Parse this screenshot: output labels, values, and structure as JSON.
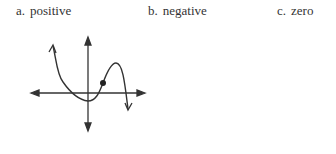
{
  "options": [
    {
      "letter": "a.",
      "label": "positive"
    },
    {
      "letter": "b.",
      "label": "negative"
    },
    {
      "letter": "c.",
      "label": "zero"
    }
  ],
  "graph": {
    "description": "Polynomial curve with up-arrow at left end, minimum near origin below x-axis, marked point on rising segment, local max above x-axis, then down-arrow at right end",
    "marked_point": "dot on curve right of y-axis, above x-axis",
    "stroke_color": "#333333"
  }
}
